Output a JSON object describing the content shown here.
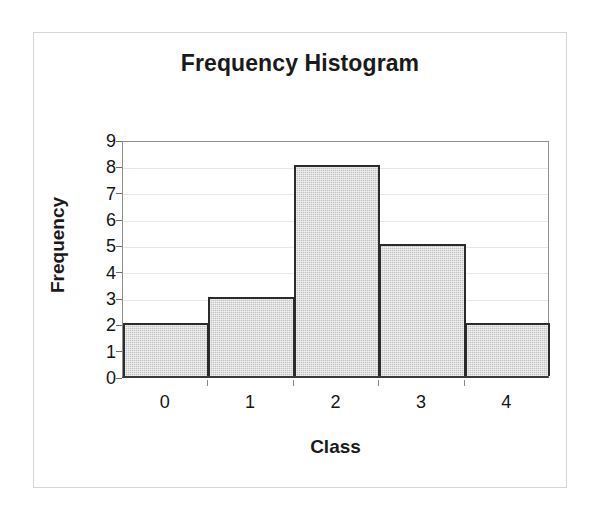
{
  "chart_data": {
    "type": "bar",
    "title": "Frequency Histogram",
    "xlabel": "Class",
    "ylabel": "Frequency",
    "categories": [
      "0",
      "1",
      "2",
      "3",
      "4"
    ],
    "values": [
      2,
      3,
      8,
      5,
      2
    ],
    "series": [
      {
        "name": "Frequency",
        "values": [
          2,
          3,
          8,
          5,
          2
        ]
      }
    ],
    "ylim": [
      0,
      9
    ],
    "ytick_labels": [
      "0",
      "1",
      "2",
      "3",
      "4",
      "5",
      "6",
      "7",
      "8",
      "9"
    ],
    "ytick_values": [
      0,
      1,
      2,
      3,
      4,
      5,
      6,
      7,
      8,
      9
    ],
    "xtick_labels": [
      "0",
      "1",
      "2",
      "3",
      "4"
    ],
    "grid": "horizontal",
    "legend": "none",
    "bar_gap": 0,
    "colors": {
      "bar_fill": "#c3c3c3",
      "bar_border": "#2b2b2b",
      "gridline": "#e6e6e6",
      "axis": "#3a3a3a",
      "plot_border": "#8e8e8e",
      "text": "#141414",
      "page_border": "#d6d6d6",
      "background": "#ffffff"
    }
  }
}
